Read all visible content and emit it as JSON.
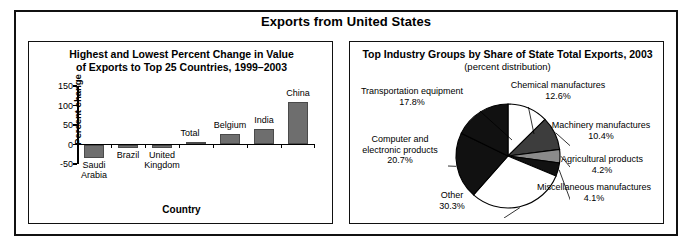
{
  "figure": {
    "title": "Exports from United States"
  },
  "left_panel": {
    "title_line1": "Highest and Lowest Percent Change in Value",
    "title_line2": "of Exports to Top 25 Countries, 1999–2003"
  },
  "right_panel": {
    "title": "Top Industry Groups by Share of State Total Exports, 2003",
    "subtitle": "(percent distribution)"
  },
  "chart_data": [
    {
      "type": "bar",
      "title": "Highest and Lowest Percent Change in Value of Exports to Top 25 Countries, 1999–2003",
      "xlabel": "Country",
      "ylabel": "Percent change",
      "categories": [
        "Saudi Arabia",
        "Brazil",
        "United Kingdom",
        "Total",
        "Belgium",
        "India",
        "China"
      ],
      "values": [
        -35,
        -10,
        -9,
        6,
        28,
        40,
        110
      ],
      "ylim": [
        -50,
        150
      ],
      "yticks": [
        -50,
        0,
        50,
        100,
        150
      ],
      "ytick_labels": [
        "-50",
        "0",
        "50",
        "100",
        "150"
      ],
      "grid": false,
      "legend": "none",
      "bar_color": "#6e6e6e"
    },
    {
      "type": "pie",
      "title": "Top Industry Groups by Share of State Total Exports, 2003",
      "subtitle": "(percent distribution)",
      "labels": [
        "Chemical manufactures",
        "Machinery manufactures",
        "Agricultural products",
        "Miscellaneous manufactures",
        "Other",
        "Computer and electronic products",
        "Transportation equipment"
      ],
      "values": [
        12.6,
        10.4,
        4.2,
        4.1,
        30.3,
        20.7,
        17.8
      ],
      "value_labels": [
        "12.6%",
        "10.4%",
        "4.2%",
        "4.1%",
        "30.3%",
        "20.7%",
        "17.8%"
      ],
      "slice_colors": [
        "#ffffff",
        "#3d3d3d",
        "#8a8a8a",
        "#111111",
        "#ffffff",
        "#111111",
        "#111111"
      ],
      "legend": "none"
    }
  ],
  "bar_labels": [
    {
      "name": "Saudi Arabia",
      "text": "Saudi\nArabia"
    },
    {
      "name": "Brazil",
      "text": "Brazil"
    },
    {
      "name": "United Kingdom",
      "text": "United\nKingdom"
    },
    {
      "name": "Total",
      "text": "Total"
    },
    {
      "name": "Belgium",
      "text": "Belgium"
    },
    {
      "name": "India",
      "text": "India"
    },
    {
      "name": "China",
      "text": "China"
    }
  ],
  "pie_callouts": [
    {
      "name": "transportation-equipment",
      "label": "Transportation equipment",
      "pct": "17.8%"
    },
    {
      "name": "chemical-manufactures",
      "label": "Chemical manufactures",
      "pct": "12.6%"
    },
    {
      "name": "machinery-manufactures",
      "label": "Machinery manufactures",
      "pct": "10.4%"
    },
    {
      "name": "agricultural-products",
      "label": "Agricultural products",
      "pct": "4.2%"
    },
    {
      "name": "miscellaneous-manufactures",
      "label": "Miscellaneous manufactures",
      "pct": "4.1%"
    },
    {
      "name": "other",
      "label": "Other",
      "pct": "30.3%"
    },
    {
      "name": "computer-electronic-products",
      "label": "Computer and\nelectronic products",
      "pct": "20.7%"
    }
  ]
}
